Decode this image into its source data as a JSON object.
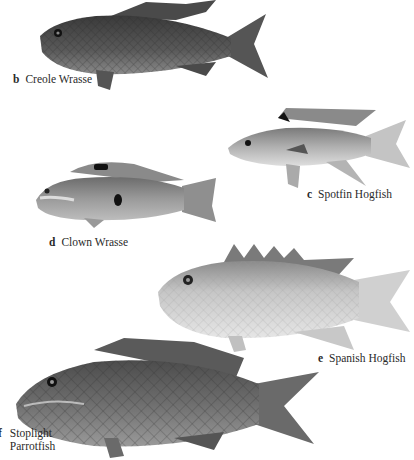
{
  "plate": {
    "background": "#ffffff",
    "species": [
      {
        "letter": "b",
        "name": "Creole Wrasse",
        "tone": "#4a4a4a"
      },
      {
        "letter": "c",
        "name": "Spotfin Hogfish",
        "tone": "#9a9a9a"
      },
      {
        "letter": "d",
        "name": "Clown Wrasse",
        "tone": "#8a8a8a"
      },
      {
        "letter": "e",
        "name": "Spanish Hogfish",
        "tone": "#b8b8b8"
      },
      {
        "letter": "f",
        "name": "Stoplight Parrotfish",
        "name_line1": "Stoplight",
        "name_line2": "Parrotfish",
        "tone": "#5e5e5e"
      }
    ]
  }
}
